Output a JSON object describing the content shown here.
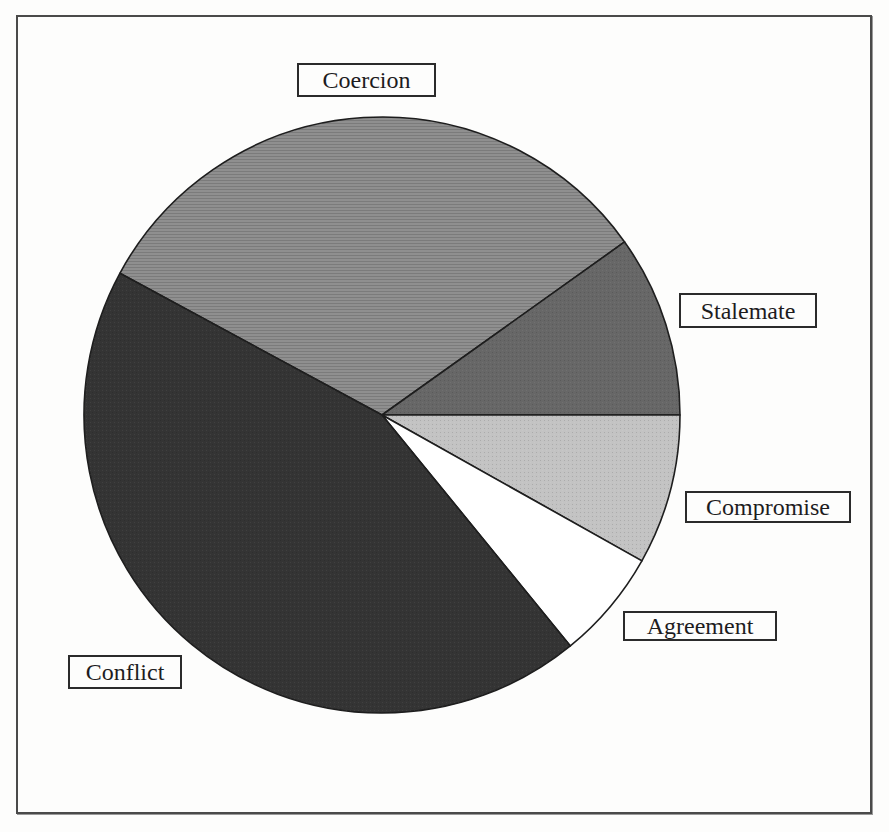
{
  "figure": {
    "kind": "scanned-book-pie-figure",
    "background_color": "#fdfdfc",
    "frame_border_color": "#4a4a4a",
    "slice_outline_color": "#1e1e1e",
    "label_box_border_color": "#2b2b2b",
    "label_text_color": "#1d1c1e"
  },
  "chart_data": {
    "type": "pie",
    "title": "",
    "legend_position": "labels-in-boxes-around-pie",
    "categories": [
      "Coercion",
      "Stalemate",
      "Compromise",
      "Agreement",
      "Conflict"
    ],
    "values_pct": [
      32,
      10,
      8,
      6,
      44
    ],
    "slices": [
      {
        "label": "Coercion",
        "value_pct": 32,
        "start_deg": 35.5,
        "end_deg": 151.6,
        "color": "#8f8f8f",
        "texture": "hlines"
      },
      {
        "label": "Stalemate",
        "value_pct": 10,
        "start_deg": 0,
        "end_deg": 35.5,
        "color": "#676767",
        "texture": "dots"
      },
      {
        "label": "Compromise",
        "value_pct": 8,
        "start_deg": 330.7,
        "end_deg": 360,
        "color": "#c3c3c3",
        "texture": "dots"
      },
      {
        "label": "Agreement",
        "value_pct": 6,
        "start_deg": 309.2,
        "end_deg": 330.7,
        "color": "#ffffff",
        "texture": "none"
      },
      {
        "label": "Conflict",
        "value_pct": 44,
        "start_deg": 151.6,
        "end_deg": 309.2,
        "color": "#343434",
        "texture": "dots"
      }
    ]
  }
}
